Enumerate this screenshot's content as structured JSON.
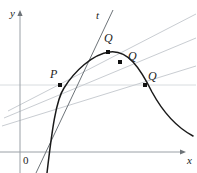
{
  "figure": {
    "axes": {
      "y_label": "y",
      "x_label": "x",
      "origin_label": "0",
      "y_axis_x": 20,
      "x_axis_y": 152,
      "x_axis_end": 186,
      "y_axis_top": 10
    },
    "labels": {
      "tangent": "t",
      "point_p": "P",
      "point_q1": "Q",
      "point_q2": "Q",
      "point_q3": "Q"
    },
    "points": [
      {
        "name": "P",
        "x": 60,
        "y": 85,
        "label_x": 50,
        "label_y": 68
      },
      {
        "name": "Q1",
        "x": 108,
        "y": 52,
        "label_x": 104,
        "label_y": 32
      },
      {
        "name": "Q2",
        "x": 120,
        "y": 62,
        "label_x": 128,
        "label_y": 50
      },
      {
        "name": "Q3",
        "x": 145,
        "y": 85,
        "label_x": 148,
        "label_y": 70
      }
    ],
    "curve_path": "M 47,173 C 52,130 56,100 64,88 C 74,72 92,54 110,52 C 128,50 140,68 152,92 C 164,114 178,128 193,136",
    "tangent_path": "M 36,173 L 113,10",
    "secant_paths": [
      "M 8,111 L 196,14",
      "M 4,118 L 196,38",
      "M 2,126 L 196,66"
    ],
    "gridline_path": "M 0,85 L 196,85",
    "colors": {
      "curve": "#1a1a1a",
      "tangent": "#6d7378",
      "secant": "#c9cdd2",
      "axis": "#9aa0a6",
      "gridline": "#d8dcdf",
      "point": "#111111",
      "label": "#1c1c1c",
      "background": "#ffffff"
    }
  }
}
